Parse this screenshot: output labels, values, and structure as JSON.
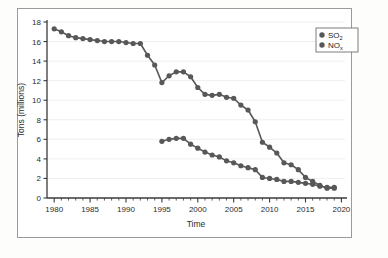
{
  "figure": {
    "background_color": "#fdfdfc",
    "panel_color": "#ffffff",
    "frame_color": "#9a9a9a",
    "series_color": "#58585a",
    "grid_color": "#e8e8e6",
    "axis_color": "#3a3a3a",
    "text_color": "#2b2b2b"
  },
  "chart_data": {
    "type": "line",
    "title": "",
    "xlabel": "Time",
    "ylabel": "Tons (millions)",
    "xlim": [
      1979,
      2020.5
    ],
    "ylim": [
      0,
      18
    ],
    "xticks": [
      1980,
      1985,
      1990,
      1995,
      2000,
      2005,
      2010,
      2015,
      2020
    ],
    "xtick_labels": [
      "1980",
      "1985",
      "1990",
      "1995",
      "2000",
      "2005",
      "2010",
      "2015",
      "2020"
    ],
    "minor_xtick_interval": 1,
    "yticks": [
      0,
      2,
      4,
      6,
      8,
      10,
      12,
      14,
      16,
      18
    ],
    "ytick_labels": [
      "0",
      "2",
      "4",
      "6",
      "8",
      "10",
      "12",
      "14",
      "16",
      "18"
    ],
    "grid": "horizontal-light",
    "legend_position": "top-right",
    "marker": "circle",
    "series": [
      {
        "name": "SO2",
        "label_main": "SO",
        "label_sub": "2",
        "color": "#58585a",
        "x": [
          1980,
          1981,
          1982,
          1983,
          1984,
          1985,
          1986,
          1987,
          1988,
          1989,
          1990,
          1991,
          1992,
          1993,
          1994,
          1995,
          1996,
          1997,
          1998,
          1999,
          2000,
          2001,
          2002,
          2003,
          2004,
          2005,
          2006,
          2007,
          2008,
          2009,
          2010,
          2011,
          2012,
          2013,
          2014,
          2015,
          2016,
          2017,
          2018,
          2019
        ],
        "values": [
          17.3,
          17.0,
          16.6,
          16.4,
          16.3,
          16.2,
          16.1,
          16.0,
          16.0,
          16.0,
          15.9,
          15.8,
          15.8,
          14.6,
          13.6,
          11.8,
          12.5,
          12.9,
          12.9,
          12.4,
          11.3,
          10.6,
          10.5,
          10.6,
          10.3,
          10.2,
          9.5,
          9.0,
          7.8,
          5.7,
          5.2,
          4.6,
          3.6,
          3.4,
          2.9,
          2.1,
          1.7,
          1.3,
          1.0,
          1.0
        ]
      },
      {
        "name": "NOx",
        "label_main": "NO",
        "label_sub": "x",
        "color": "#58585a",
        "x": [
          1995,
          1996,
          1997,
          1998,
          1999,
          2000,
          2001,
          2002,
          2003,
          2004,
          2005,
          2006,
          2007,
          2008,
          2009,
          2010,
          2011,
          2012,
          2013,
          2014,
          2015,
          2016,
          2017,
          2018,
          2019
        ],
        "values": [
          5.8,
          6.0,
          6.1,
          6.1,
          5.5,
          5.1,
          4.7,
          4.4,
          4.2,
          3.8,
          3.6,
          3.3,
          3.1,
          2.9,
          2.1,
          2.0,
          1.9,
          1.7,
          1.7,
          1.6,
          1.5,
          1.4,
          1.2,
          1.1,
          1.1
        ]
      }
    ]
  }
}
